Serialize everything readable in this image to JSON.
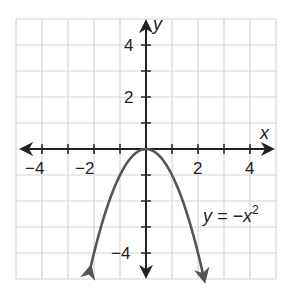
{
  "chart_data": {
    "type": "line",
    "title": "",
    "xlabel": "x",
    "ylabel": "y",
    "xlim": [
      -5,
      5
    ],
    "ylim": [
      -5,
      5
    ],
    "grid": true,
    "xticks": [
      -4,
      -2,
      2,
      4
    ],
    "yticks": [
      4,
      2,
      -4
    ],
    "xtick_labels": [
      "−4",
      "−2",
      "2",
      "4"
    ],
    "ytick_labels": [
      "4",
      "2",
      "−4"
    ],
    "series": [
      {
        "name": "y = −x²",
        "function": "y = -x^2",
        "x": [
          -2.2,
          -2,
          -1.5,
          -1,
          -0.5,
          0,
          0.5,
          1,
          1.5,
          2,
          2.2
        ],
        "y": [
          -4.84,
          -4,
          -2.25,
          -1,
          -0.25,
          0,
          -0.25,
          -1,
          -2.25,
          -4,
          -4.84
        ],
        "arrows_at_ends": true,
        "color": "#555555"
      }
    ],
    "annotations": [
      {
        "text": "y = −x",
        "superscript": "2",
        "x": 2,
        "y": -2.5
      }
    ],
    "legend": null
  },
  "labels": {
    "x_axis": "x",
    "y_axis": "y",
    "equation_main": "y = −x",
    "equation_sup": "2",
    "xt_neg4": "−4",
    "xt_neg2": "−2",
    "xt_2": "2",
    "xt_4": "4",
    "yt_4": "4",
    "yt_2": "2",
    "yt_neg4": "−4"
  },
  "colors": {
    "grid": "#d4d4d4",
    "axis": "#222222",
    "curve": "#555555"
  }
}
